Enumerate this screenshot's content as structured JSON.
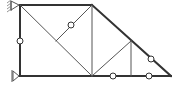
{
  "diagram": {
    "type": "truss-structure",
    "stroke_color": "#333333",
    "thin_stroke_color": "#555555",
    "node_fill": "#ffffff",
    "supports": [
      {
        "name": "fixed-support-top",
        "x": 20,
        "y": 5
      },
      {
        "name": "pin-support-bottom",
        "x": 20,
        "y": 76
      }
    ],
    "members": [
      {
        "x1": 20,
        "y1": 5,
        "x2": 92,
        "y2": 5,
        "w": 2
      },
      {
        "x1": 92,
        "y1": 5,
        "x2": 171,
        "y2": 76,
        "w": 2
      },
      {
        "x1": 20,
        "y1": 76,
        "x2": 171,
        "y2": 76,
        "w": 2
      },
      {
        "x1": 20,
        "y1": 5,
        "x2": 20,
        "y2": 76,
        "w": 2
      },
      {
        "x1": 20,
        "y1": 5,
        "x2": 92,
        "y2": 76,
        "w": 1
      },
      {
        "x1": 92,
        "y1": 5,
        "x2": 92,
        "y2": 76,
        "w": 1
      },
      {
        "x1": 56,
        "y1": 41,
        "x2": 92,
        "y2": 5,
        "w": 1
      },
      {
        "x1": 92,
        "y1": 76,
        "x2": 131,
        "y2": 41,
        "w": 1
      },
      {
        "x1": 131,
        "y1": 41,
        "x2": 131,
        "y2": 76,
        "w": 1
      }
    ],
    "hinges": [
      {
        "x": 20,
        "y": 41
      },
      {
        "x": 71,
        "y": 25
      },
      {
        "x": 113,
        "y": 76
      },
      {
        "x": 149,
        "y": 76
      },
      {
        "x": 151,
        "y": 59
      }
    ]
  }
}
